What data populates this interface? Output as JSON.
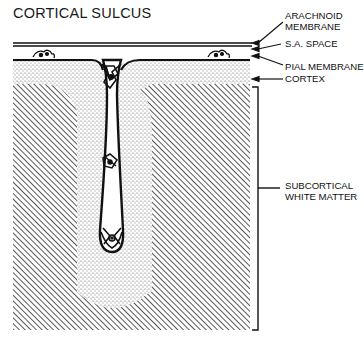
{
  "figure": {
    "title": "CORTICAL SULCUS",
    "labels": {
      "arachnoid": "ARACHNOID\nMEMBRANE",
      "sa_space": "S.A. SPACE",
      "pial": "PIAL MEMBRANE",
      "cortex": "CORTEX",
      "subcortical": "SUBCORTICAL\nWHITE MATTER"
    },
    "regions": [
      {
        "name": "Arachnoid membrane",
        "pattern": "double line"
      },
      {
        "name": "Subarachnoid space",
        "pattern": "blank"
      },
      {
        "name": "Pial membrane",
        "pattern": "thick line"
      },
      {
        "name": "Cortex",
        "pattern": "stippled"
      },
      {
        "name": "Subcortical white matter",
        "pattern": "diagonal hatching"
      }
    ],
    "colors": {
      "ink": "#111111",
      "background": "#ffffff",
      "stipple": "#6a6a6a",
      "hatch": "#3a3a3a"
    }
  }
}
